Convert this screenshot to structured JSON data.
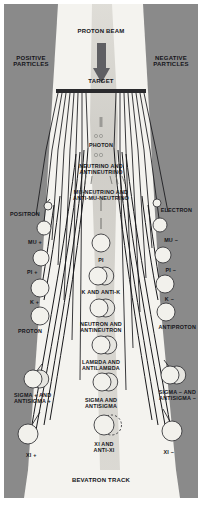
{
  "diagram": {
    "type": "physics-schematic",
    "colors": {
      "panel_gray": "#8a8a8a",
      "panel_gray_dark": "#7e7e7e",
      "paper_white": "#f4f3ef",
      "beam_band": "#cfcdc7",
      "track_black": "#17171a",
      "circle_fill": "#f2f1ec",
      "circle_stroke": "#3a3a3d",
      "target_bar": "#2a2a2d",
      "text": "#15151a"
    },
    "headers": {
      "beam": "PROTON BEAM",
      "target": "TARGET",
      "left_panel": "POSITIVE\nPARTICLES",
      "right_panel": "NEGATIVE\nPARTICLES",
      "footer": "BEVATRON TRACK"
    },
    "center_labels": [
      {
        "id": "photon",
        "text": "PHOTON",
        "x": 101,
        "y": 143,
        "size": "l7",
        "marker": "dots"
      },
      {
        "id": "neutrino",
        "text": "NEUTRINO AND\nANTINEUTRINO",
        "x": 101,
        "y": 164,
        "size": "l7",
        "marker": "dots2"
      },
      {
        "id": "mu-neutrino",
        "text": "MU-NEUTRINO AND\nANTI-MU-NEUTRINO",
        "x": 101,
        "y": 190,
        "size": "l7",
        "marker": "dots3"
      }
    ],
    "center_particles": [
      {
        "id": "pi",
        "text": "PI",
        "x": 101,
        "y": 258,
        "size": "l7",
        "circle": "single",
        "cx": 101,
        "cy": 243,
        "r": 9
      },
      {
        "id": "k-antik",
        "text": "K AND ANTI-K",
        "x": 101,
        "y": 290,
        "size": "l7",
        "circle": "double",
        "cx": 98,
        "cy": 276,
        "r": 9
      },
      {
        "id": "neutron",
        "text": "NEUTRON AND\nANTINEUTRON",
        "x": 101,
        "y": 322,
        "size": "l7",
        "circle": "double",
        "cx": 99,
        "cy": 308,
        "r": 9
      },
      {
        "id": "lambda",
        "text": "LAMBDA AND\nANTILAMBDA",
        "x": 101,
        "y": 360,
        "size": "l7",
        "circle": "double",
        "cx": 101,
        "cy": 345,
        "r": 9
      },
      {
        "id": "sigma",
        "text": "SIGMA AND\nANTISIGMA",
        "x": 101,
        "y": 398,
        "size": "l7",
        "circle": "double",
        "cx": 102,
        "cy": 382,
        "r": 9
      },
      {
        "id": "xi",
        "text": "XI AND\nANTI-XI",
        "x": 104,
        "y": 442,
        "size": "l7",
        "circle": "dashed",
        "cx": 104,
        "cy": 425,
        "r": 10
      }
    ],
    "left_particles": [
      {
        "id": "positron",
        "text": "POSITRON",
        "x": 10,
        "y": 212,
        "size": "l7",
        "circle": "small",
        "cx": 48,
        "cy": 206,
        "r": 4
      },
      {
        "id": "mu-plus",
        "text": "MU +",
        "x": 28,
        "y": 240,
        "size": "l7",
        "circle": "single",
        "cx": 44,
        "cy": 228,
        "r": 7
      },
      {
        "id": "pi-plus",
        "text": "PI +",
        "x": 27,
        "y": 270,
        "size": "l7",
        "circle": "single",
        "cx": 41,
        "cy": 258,
        "r": 8
      },
      {
        "id": "k-plus",
        "text": "K +",
        "x": 30,
        "y": 300,
        "size": "l7",
        "circle": "single",
        "cx": 40,
        "cy": 288,
        "r": 9
      },
      {
        "id": "proton",
        "text": "PROTON",
        "x": 18,
        "y": 329,
        "size": "l7",
        "circle": "single",
        "cx": 40,
        "cy": 316,
        "r": 9
      },
      {
        "id": "sigma-plus",
        "text": "SIGMA + AND\nANTISIGMA +",
        "x": 14,
        "y": 393,
        "size": "l7",
        "circle": "double",
        "cx": 33,
        "cy": 379,
        "r": 9
      },
      {
        "id": "xi-plus",
        "text": "XI +",
        "x": 26,
        "y": 453,
        "size": "l7",
        "circle": "single",
        "cx": 28,
        "cy": 434,
        "r": 10
      }
    ],
    "right_particles": [
      {
        "id": "electron",
        "text": "ELECTRON",
        "x": 192,
        "y": 208,
        "size": "l7",
        "circle": "small",
        "cx": 157,
        "cy": 203,
        "r": 4
      },
      {
        "id": "mu-minus",
        "text": "MU −",
        "x": 178,
        "y": 238,
        "size": "l7",
        "circle": "single",
        "cx": 160,
        "cy": 225,
        "r": 7
      },
      {
        "id": "pi-minus",
        "text": "PI −",
        "x": 176,
        "y": 268,
        "size": "l7",
        "circle": "single",
        "cx": 163,
        "cy": 255,
        "r": 8
      },
      {
        "id": "k-minus",
        "text": "K −",
        "x": 174,
        "y": 297,
        "size": "l7",
        "circle": "single",
        "cx": 165,
        "cy": 284,
        "r": 9
      },
      {
        "id": "antiproton",
        "text": "ANTIPROTON",
        "x": 196,
        "y": 325,
        "size": "l7",
        "circle": "single",
        "cx": 166,
        "cy": 312,
        "r": 9
      },
      {
        "id": "sigma-minus",
        "text": "SIGMA − AND\nANTISIGMA −",
        "x": 196,
        "y": 390,
        "size": "l7",
        "circle": "double",
        "cx": 170,
        "cy": 375,
        "r": 9
      },
      {
        "id": "xi-minus",
        "text": "XI −",
        "x": 174,
        "y": 450,
        "size": "l7",
        "circle": "single",
        "cx": 172,
        "cy": 431,
        "r": 10
      }
    ]
  }
}
